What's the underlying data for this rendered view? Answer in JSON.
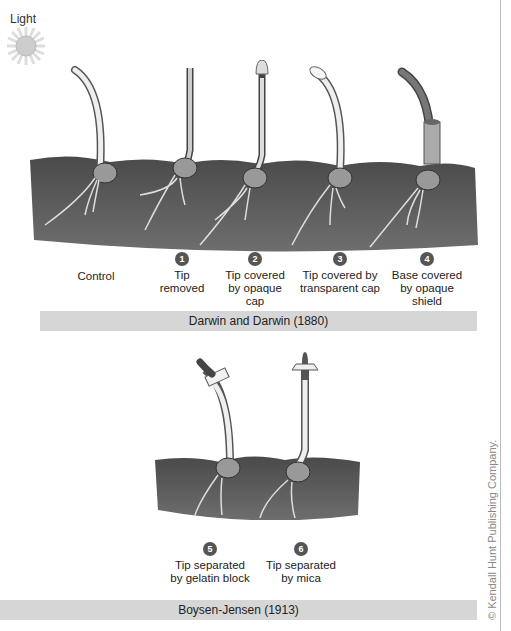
{
  "light": {
    "label": "Light",
    "icon": "sun-icon"
  },
  "darwin": {
    "title": "Darwin and Darwin (1880)",
    "experiments": [
      {
        "number": "",
        "label": "Control"
      },
      {
        "number": "1",
        "label": "Tip removed"
      },
      {
        "number": "2",
        "label": "Tip covered by opaque cap"
      },
      {
        "number": "3",
        "label": "Tip covered by transparent cap"
      },
      {
        "number": "4",
        "label": "Base covered by opaque shield"
      }
    ]
  },
  "boysen": {
    "title": "Boysen-Jensen (1913)",
    "experiments": [
      {
        "number": "5",
        "label": "Tip separated by gelatin block"
      },
      {
        "number": "6",
        "label": "Tip separated by mica"
      }
    ]
  },
  "credit": "© Kendall Hunt Publishing Company."
}
